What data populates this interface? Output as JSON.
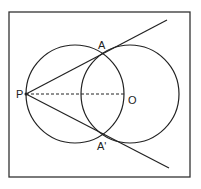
{
  "diagram": {
    "labels": {
      "P": "P",
      "A": "A",
      "A_prime": "A'",
      "O": "O"
    },
    "colors": {
      "stroke": "#222222",
      "background": "#ffffff"
    },
    "geometry": {
      "frame": {
        "x": 9,
        "y": 12,
        "w": 181,
        "h": 165
      },
      "P": [
        26,
        94
      ],
      "A": [
        102,
        55
      ],
      "A_prime": [
        102,
        133
      ],
      "O": [
        124,
        94
      ],
      "left_circle": {
        "cx": 75,
        "cy": 94,
        "r": 49
      },
      "right_circle": {
        "cx": 130,
        "cy": 94,
        "r": 49
      },
      "tangent_upper_end": [
        167,
        20
      ],
      "tangent_lower_end": [
        169,
        168
      ]
    }
  }
}
